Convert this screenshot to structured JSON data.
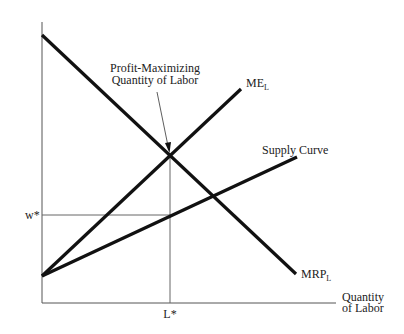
{
  "diagram": {
    "type": "labor-market-monopsony",
    "axes": {
      "x_label_line1": "Quantity",
      "x_label_line2": "of Labor",
      "y_label": ""
    },
    "curves": [
      {
        "id": "mrp",
        "label": "MRP",
        "subscript": "L",
        "slope": "downward"
      },
      {
        "id": "me",
        "label": "ME",
        "subscript": "L",
        "slope": "upward-steep"
      },
      {
        "id": "supply",
        "label": "Supply Curve",
        "subscript": "",
        "slope": "upward-shallow"
      }
    ],
    "annotations": {
      "profit_max_line1": "Profit-Maximizing",
      "profit_max_line2": "Quantity of Labor",
      "w_star": "w*",
      "l_star": "L*"
    },
    "colors": {
      "curve": "#111111",
      "axis": "#555555",
      "guide": "#666666"
    }
  }
}
